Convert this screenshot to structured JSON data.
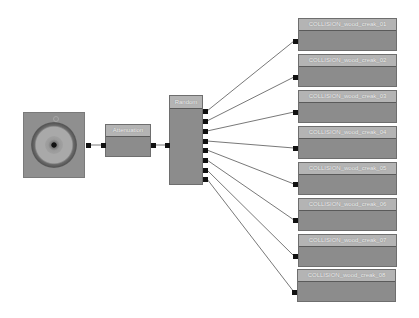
{
  "graph": {
    "source": {
      "label": "",
      "icon": "speaker-icon"
    },
    "attenuation": {
      "label": "Attenuation"
    },
    "random": {
      "label": "Random"
    },
    "targets": [
      {
        "label": "COLLISION_wood_creak_01"
      },
      {
        "label": "COLLISION_wood_creak_02"
      },
      {
        "label": "COLLISION_wood_creak_03"
      },
      {
        "label": "COLLISION_wood_creak_04"
      },
      {
        "label": "COLLISION_wood_creak_05"
      },
      {
        "label": "COLLISION_wood_creak_06"
      },
      {
        "label": "COLLISION_wood_creak_07"
      },
      {
        "label": "COLLISION_wood_creak_08"
      }
    ]
  },
  "colors": {
    "background": "#ffffff",
    "node_body": "#8c8c8c",
    "node_header": "#b4b4b4",
    "port": "#111111",
    "wire": "#555555"
  }
}
